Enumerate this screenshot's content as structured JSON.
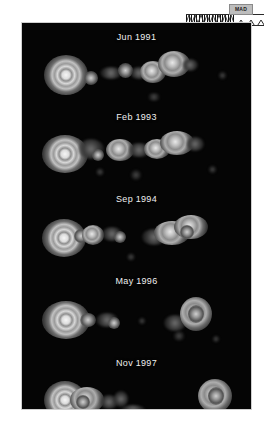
{
  "figure": {
    "background_color": "#ffffff",
    "canvas_color": "#050505",
    "canvas_border_color": "#cfcfcf"
  },
  "scale_marker": {
    "label": "MAD",
    "north_arrow_icon": "north-arrow-icon",
    "hatch_icon": "hatch-ruler-icon",
    "triangle_icon": "triangle-ruler-icon"
  },
  "panels": [
    {
      "label": "Jun 1991"
    },
    {
      "label": "Feb 1993"
    },
    {
      "label": "Sep 1994"
    },
    {
      "label": "May 1996"
    },
    {
      "label": "Nov 1997"
    }
  ]
}
